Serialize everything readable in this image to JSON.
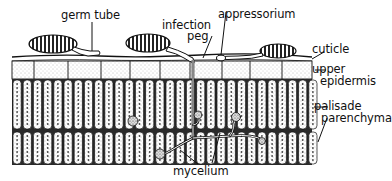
{
  "diagram": {
    "labels": {
      "germ_tube": "germ tube",
      "infection_peg_line1": "infection",
      "infection_peg_line2": "peg",
      "appressorium": "appressorium",
      "cuticle": "cuticle",
      "upper_epidermis_line1": "upper",
      "upper_epidermis_line2": "epidermis",
      "palisade_line1": "palisade",
      "palisade_line2": "parenchyma",
      "mycelium": "mycelium"
    },
    "colors": {
      "ink": "#111111",
      "paper": "#ffffff",
      "stipple": "#9a9a9a"
    }
  }
}
